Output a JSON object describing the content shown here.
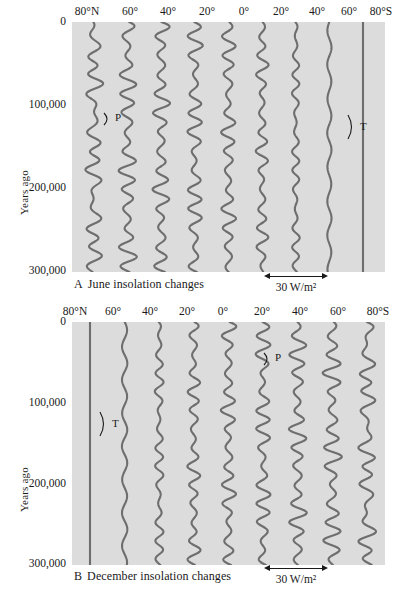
{
  "figure": {
    "yaxis_title": "Years ago",
    "yticks": [
      "0",
      "100,000",
      "200,000",
      "300,000"
    ],
    "ytick_values": [
      0,
      100000,
      200000,
      300000
    ],
    "scale_label": "30 W/m²",
    "trace_color": "#6e6e6e",
    "plot_background": "#dcdcdc",
    "annotation_precession": "P",
    "annotation_tilt": "T"
  },
  "panels": [
    {
      "id": "A",
      "letter": "A",
      "caption": "June insolation changes",
      "latitudes": [
        "80°N",
        "60°",
        "40°",
        "20°",
        "0°",
        "20°",
        "40°",
        "60°",
        "80°S"
      ],
      "annotations": [
        {
          "label": "P",
          "latitude": "60°",
          "years_ago": 105000
        },
        {
          "label": "T",
          "latitude": "60°S",
          "years_ago": 128000
        }
      ]
    },
    {
      "id": "B",
      "letter": "B",
      "caption": "December insolation changes",
      "latitudes": [
        "80°N",
        "60°",
        "40°",
        "20°",
        "0°",
        "20°",
        "40°",
        "60°",
        "80°S"
      ],
      "annotations": [
        {
          "label": "P",
          "latitude": "40°S",
          "years_ago": 48000
        },
        {
          "label": "T",
          "latitude": "80°N",
          "years_ago": 130000
        }
      ]
    }
  ],
  "chart_data": {
    "type": "line",
    "xlabel": "Latitude",
    "ylabel": "Years ago",
    "ylim": [
      0,
      300000
    ],
    "y_inverted": true,
    "grid": false,
    "legend": "none",
    "units": "W/m²",
    "scale_bar": 30,
    "panels": [
      {
        "panel": "A",
        "title": "June insolation changes",
        "series": [
          {
            "name": "80°N",
            "amplitude": 34,
            "dominant_cycle": "precession+tilt",
            "period_ka": 23
          },
          {
            "name": "60°",
            "amplitude": 32,
            "dominant_cycle": "precession",
            "period_ka": 23
          },
          {
            "name": "40°",
            "amplitude": 30,
            "dominant_cycle": "precession",
            "period_ka": 23
          },
          {
            "name": "20°",
            "amplitude": 29,
            "dominant_cycle": "precession",
            "period_ka": 23
          },
          {
            "name": "0°",
            "amplitude": 26,
            "dominant_cycle": "precession",
            "period_ka": 23
          },
          {
            "name": "20°S",
            "amplitude": 22,
            "dominant_cycle": "precession",
            "period_ka": 23
          },
          {
            "name": "40°S",
            "amplitude": 15,
            "dominant_cycle": "precession",
            "period_ka": 23
          },
          {
            "name": "60°S",
            "amplitude": 9,
            "dominant_cycle": "tilt",
            "period_ka": 41
          },
          {
            "name": "80°S",
            "amplitude": 0,
            "dominant_cycle": "none",
            "period_ka": 0
          }
        ]
      },
      {
        "panel": "B",
        "title": "December insolation changes",
        "series": [
          {
            "name": "80°N",
            "amplitude": 0,
            "dominant_cycle": "none",
            "period_ka": 0
          },
          {
            "name": "60°",
            "amplitude": 9,
            "dominant_cycle": "tilt",
            "period_ka": 41
          },
          {
            "name": "40°",
            "amplitude": 17,
            "dominant_cycle": "precession",
            "period_ka": 23
          },
          {
            "name": "20°",
            "amplitude": 23,
            "dominant_cycle": "precession",
            "period_ka": 23
          },
          {
            "name": "0°",
            "amplitude": 26,
            "dominant_cycle": "precession",
            "period_ka": 23
          },
          {
            "name": "20°S",
            "amplitude": 29,
            "dominant_cycle": "precession",
            "period_ka": 23
          },
          {
            "name": "40°S",
            "amplitude": 31,
            "dominant_cycle": "precession",
            "period_ka": 23
          },
          {
            "name": "60°S",
            "amplitude": 33,
            "dominant_cycle": "precession",
            "period_ka": 23
          },
          {
            "name": "80°S",
            "amplitude": 35,
            "dominant_cycle": "precession+tilt",
            "period_ka": 23
          }
        ]
      }
    ]
  }
}
